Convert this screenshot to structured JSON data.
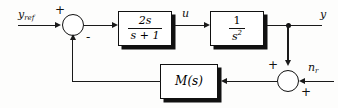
{
  "diagram": {
    "line_color": "#1a1a1a",
    "block_fill": "#ffffff",
    "background": "#fdfdfc",
    "signals": {
      "reference": "y",
      "reference_sub": "ref",
      "control": "u",
      "output": "y",
      "noise": "n",
      "noise_sub": "r"
    },
    "blocks": [
      {
        "id": "controller",
        "numerator": "2s",
        "denominator": "s + 1"
      },
      {
        "id": "plant",
        "numerator": "1",
        "denominator": "s",
        "denominator_exponent": "2"
      },
      {
        "id": "feedback",
        "label": "M(s)"
      }
    ],
    "junctions": [
      {
        "id": "error-junction",
        "inputs": [
          {
            "port": "left",
            "sign": "+"
          },
          {
            "port": "bottom",
            "sign": "-"
          }
        ]
      },
      {
        "id": "noise-junction",
        "inputs": [
          {
            "port": "top",
            "sign": "+"
          },
          {
            "port": "right",
            "sign": "+"
          }
        ]
      }
    ]
  }
}
